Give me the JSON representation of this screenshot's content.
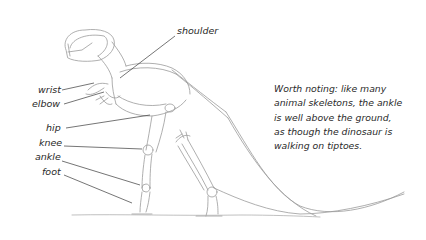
{
  "figure": {
    "labels": {
      "shoulder": "shoulder",
      "wrist": "wrist",
      "elbow": "elbow",
      "hip": "hip",
      "knee": "knee",
      "ankle": "ankle",
      "foot": "foot"
    },
    "note": {
      "lines": [
        "Worth noting: like many",
        "animal skeletons, the ankle",
        "is well above the ground,",
        "as though the dinosaur is",
        "walking on tiptoes."
      ]
    },
    "colors": {
      "sketch": "#8a8a8a",
      "leader": "#3a3a3a",
      "text": "#2a2a2a",
      "background": "#ffffff"
    }
  }
}
